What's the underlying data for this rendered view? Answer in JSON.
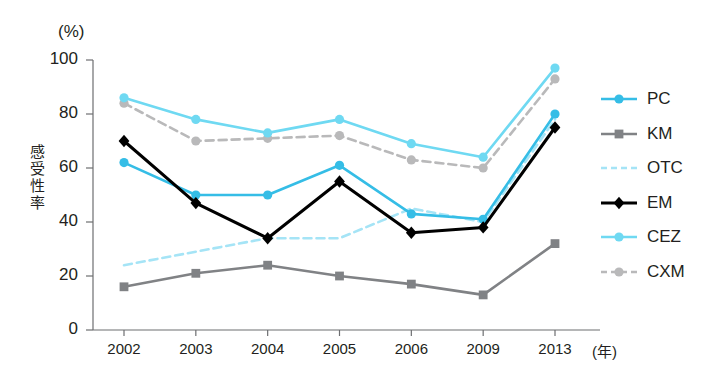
{
  "chart_data": {
    "type": "line",
    "title": "",
    "xlabel": "(年)",
    "ylabel": "感受性率",
    "yunit": "(%)",
    "ylim": [
      0,
      100
    ],
    "yticks": [
      "0",
      "20",
      "40",
      "60",
      "80",
      "100"
    ],
    "grid": false,
    "legend_position": "right",
    "categories": [
      "2002",
      "2003",
      "2004",
      "2005",
      "2006",
      "2009",
      "2013"
    ],
    "series": [
      {
        "name": "PC",
        "values": [
          62,
          50,
          50,
          61,
          43,
          41,
          80
        ],
        "color": "#35bde6",
        "marker": "circle",
        "dash": "solid"
      },
      {
        "name": "KM",
        "values": [
          16,
          21,
          24,
          20,
          17,
          13,
          32
        ],
        "color": "#808285",
        "marker": "square",
        "dash": "solid"
      },
      {
        "name": "OTC",
        "values": [
          24,
          29,
          34,
          34,
          45,
          40,
          78
        ],
        "color": "#a5e4f6",
        "marker": "none",
        "dash": "dashed"
      },
      {
        "name": "EM",
        "values": [
          70,
          47,
          34,
          55,
          36,
          38,
          75
        ],
        "color": "#000000",
        "marker": "diamond",
        "dash": "solid"
      },
      {
        "name": "CEZ",
        "values": [
          86,
          78,
          73,
          78,
          69,
          64,
          97
        ],
        "color": "#6fd9f2",
        "marker": "circle",
        "dash": "solid"
      },
      {
        "name": "CXM",
        "values": [
          84,
          70,
          71,
          72,
          63,
          60,
          93
        ],
        "color": "#b9b9ba",
        "marker": "circle",
        "dash": "dashed"
      }
    ]
  },
  "legend": {
    "items": [
      {
        "label": "PC"
      },
      {
        "label": "KM"
      },
      {
        "label": "OTC"
      },
      {
        "label": "EM"
      },
      {
        "label": "CEZ"
      },
      {
        "label": "CXM"
      }
    ]
  },
  "axis": {
    "y_unit_label": "(%)",
    "y_title_chars": [
      "感",
      "受",
      "性",
      "率"
    ],
    "x_unit_label": "(年)"
  }
}
